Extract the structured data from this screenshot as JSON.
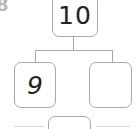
{
  "problem": {
    "number": "8"
  },
  "number_bond": {
    "whole": "10",
    "parts": [
      {
        "value": "9"
      },
      {
        "value": ""
      }
    ],
    "bottom_box": {
      "value": ""
    }
  },
  "colors": {
    "border": "#a8a8a8",
    "text": "#222222",
    "problem_number": "#b8b8b8"
  }
}
